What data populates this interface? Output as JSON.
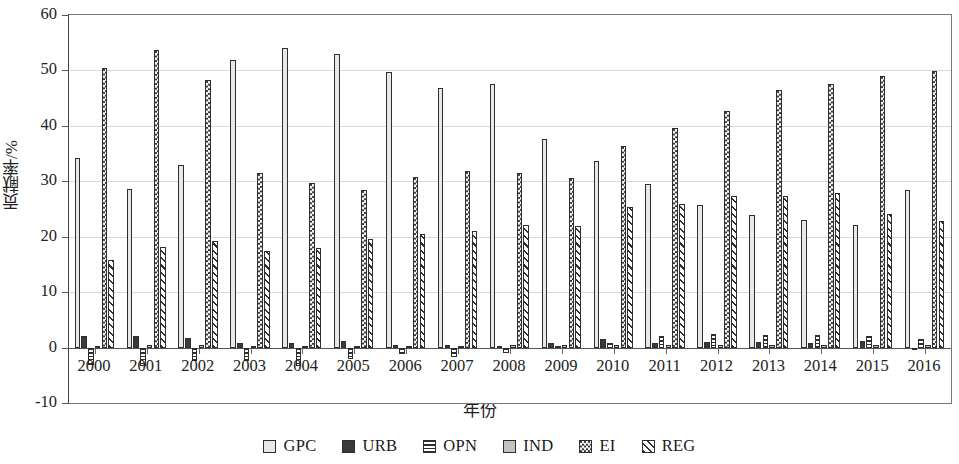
{
  "chart_data": {
    "type": "bar",
    "title": "",
    "xlabel": "年份",
    "ylabel": "贡献率/%",
    "ylim": [
      -10,
      60
    ],
    "yticks": [
      60,
      50,
      40,
      30,
      20,
      10,
      0,
      -10
    ],
    "grid": true,
    "legend_position": "bottom",
    "categories": [
      "2000",
      "2001",
      "2002",
      "2003",
      "2004",
      "2005",
      "2006",
      "2007",
      "2008",
      "2009",
      "2010",
      "2011",
      "2012",
      "2013",
      "2014",
      "2015",
      "2016"
    ],
    "series": [
      {
        "name": "GPC",
        "values": [
          34.2,
          28.6,
          33.0,
          51.8,
          54.0,
          53.0,
          49.7,
          46.9,
          47.5,
          37.7,
          33.7,
          29.6,
          25.8,
          23.9,
          23.1,
          22.1,
          28.4
        ]
      },
      {
        "name": "URB",
        "values": [
          2.0,
          2.0,
          1.8,
          0.8,
          0.8,
          1.1,
          0.5,
          0.4,
          0.3,
          0.9,
          1.5,
          0.9,
          1.0,
          1.0,
          0.9,
          1.1,
          0.0
        ]
      },
      {
        "name": "OPN",
        "values": [
          -3.1,
          -3.3,
          -2.4,
          -2.5,
          -3.3,
          -2.1,
          -1.2,
          -1.7,
          -0.9,
          0.2,
          0.8,
          2.0,
          2.4,
          2.2,
          2.3,
          2.0,
          1.6
        ]
      },
      {
        "name": "IND",
        "values": [
          0.3,
          0.4,
          0.4,
          0.3,
          0.3,
          0.3,
          0.3,
          0.3,
          0.4,
          0.4,
          0.5,
          0.5,
          0.5,
          0.5,
          0.5,
          0.5,
          0.5
        ]
      },
      {
        "name": "EI",
        "values": [
          50.4,
          53.6,
          48.3,
          31.5,
          29.7,
          28.5,
          30.8,
          31.9,
          31.5,
          30.6,
          36.4,
          39.6,
          42.7,
          46.5,
          47.6,
          49.0,
          49.9
        ]
      },
      {
        "name": "REG",
        "values": [
          15.8,
          18.2,
          19.2,
          17.4,
          17.9,
          19.6,
          20.4,
          21.0,
          22.1,
          22.0,
          25.4,
          25.9,
          27.3,
          27.3,
          27.8,
          24.1,
          22.8
        ]
      }
    ],
    "legend": [
      "GPC",
      "URB",
      "OPN",
      "IND",
      "EI",
      "REG"
    ]
  },
  "colors": {
    "gpc": "#e8e8e6",
    "urb": "#3a3a3a",
    "opn": "#ffffff",
    "ind": "#c2c2c0",
    "ei": "#f2f2f0",
    "reg": "#fbfbfb",
    "axis": "#444444",
    "grid": "#d9d9d9"
  }
}
